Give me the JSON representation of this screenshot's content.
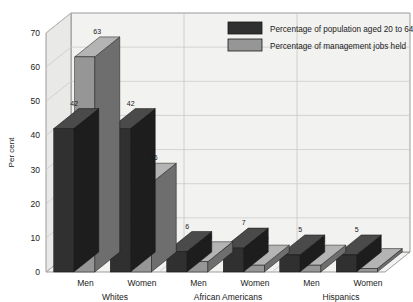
{
  "chart_data": {
    "type": "bar",
    "title": "",
    "subtitle": "",
    "xlabel": "",
    "ylabel": "Per cent",
    "ylim": [
      0,
      70
    ],
    "ytick_step": 10,
    "yticks": [
      "0",
      "10",
      "20",
      "30",
      "40",
      "50",
      "60",
      "70"
    ],
    "grid": true,
    "three_d": true,
    "legend_position": "top-right",
    "categories": [
      "Men",
      "Women",
      "Men",
      "Women",
      "Men",
      "Women"
    ],
    "groups": [
      {
        "name": "Whites",
        "categories": [
          "Men",
          "Women"
        ]
      },
      {
        "name": "African Americans",
        "categories": [
          "Men",
          "Women"
        ]
      },
      {
        "name": "Hispanics",
        "categories": [
          "Men",
          "Women"
        ]
      }
    ],
    "series": [
      {
        "name": "Percentage of population aged 20 to 64",
        "color": "#303030",
        "values": [
          42,
          42,
          6,
          7,
          5,
          5
        ]
      },
      {
        "name": "Percentage of management jobs held",
        "color": "#969696",
        "values": [
          63,
          26,
          3,
          2,
          2,
          1
        ]
      }
    ],
    "points": [
      {
        "group": "Whites",
        "category": "Men",
        "population": 42,
        "management": 63
      },
      {
        "group": "Whites",
        "category": "Women",
        "population": 42,
        "management": 26
      },
      {
        "group": "African Americans",
        "category": "Men",
        "population": 6,
        "management": 3
      },
      {
        "group": "African Americans",
        "category": "Women",
        "population": 7,
        "management": 2
      },
      {
        "group": "Hispanics",
        "category": "Men",
        "population": 5,
        "management": 2
      },
      {
        "group": "Hispanics",
        "category": "Women",
        "population": 5,
        "management": 1
      }
    ]
  },
  "legend": {
    "items": [
      {
        "label": "Percentage of population aged 20 to 64",
        "color": "#303030"
      },
      {
        "label": "Percentage of management jobs held",
        "color": "#969696"
      }
    ]
  },
  "colors": {
    "plot_background": "#f2f2f0",
    "wall_background": "#e9e9e7",
    "grid": "#c6c6c6",
    "axis": "#777777",
    "dark_bar": "#303030",
    "dark_bar_top": "#4a4a4a",
    "dark_bar_side": "#1d1d1d",
    "gray_bar": "#969696",
    "gray_bar_top": "#b4b4b4",
    "gray_bar_side": "#6e6e6e",
    "text": "#1a1a1a"
  }
}
